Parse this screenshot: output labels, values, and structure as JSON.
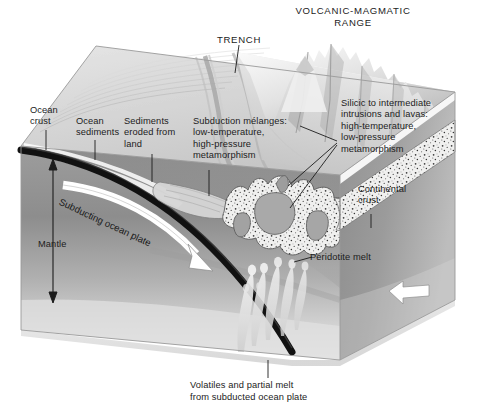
{
  "figure": {
    "type": "geological-block-diagram",
    "headings": [
      {
        "id": "trench",
        "text": "TRENCH"
      },
      {
        "id": "volcanic-magmatic-range",
        "text": "VOLCANIC-MAGMATIC\nRANGE"
      }
    ],
    "labels": [
      {
        "id": "ocean-crust",
        "text": "Ocean\ncrust"
      },
      {
        "id": "ocean-sediments",
        "text": "Ocean\nsediments"
      },
      {
        "id": "sediments-eroded",
        "text": "Sediments\neroded from\nland"
      },
      {
        "id": "subduction-melanges",
        "text": "Subduction mélanges:\nlow-temperature,\nhigh-pressure\nmetamorphism"
      },
      {
        "id": "silicic-intrusions",
        "text": "Silicic to intermediate\nintrusions and lavas:\nhigh-temperature,\nlow-pressure\nmetamorphism"
      },
      {
        "id": "continental-crust",
        "text": "Continental\ncrust"
      },
      {
        "id": "peridotite-melt",
        "text": "Peridotite melt"
      },
      {
        "id": "mantle",
        "text": "Mantle"
      },
      {
        "id": "subducting-ocean-plate",
        "text": "Subducting ocean plate"
      },
      {
        "id": "volatiles-caption",
        "text": "Volatiles and partial melt\nfrom subducted ocean plate"
      }
    ],
    "arrows": [
      {
        "id": "subduction-arrow",
        "style": "white curved arrow",
        "direction": "down-right along slab"
      },
      {
        "id": "convergence-arrow",
        "style": "white straight arrow",
        "direction": "left"
      },
      {
        "id": "mantle-extent-arrow",
        "style": "black double-headed arrow",
        "direction": "vertical"
      }
    ],
    "colors": {
      "ink": "#1c1c1c",
      "slab_line": "#111111",
      "mantle_light": "#b7b7b7",
      "mantle_dark": "#848484",
      "top_surface": "#d9d9d9",
      "continental_crust": "#efefef",
      "pluton": "#a9a9a9",
      "arrow_white": "#ffffff",
      "background": "#ffffff"
    }
  }
}
